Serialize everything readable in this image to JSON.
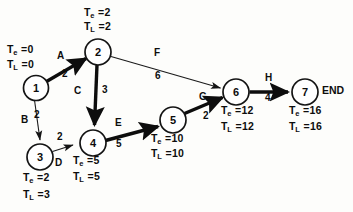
{
  "diagram": {
    "end_label": "END",
    "nodes": [
      {
        "id": "1",
        "label": "1",
        "cx": 36,
        "cy": 88,
        "r": 12.5,
        "te": "T",
        "te_sub": "e",
        "te_val": "= 0",
        "tl": "T",
        "tl_sub": "L",
        "tl_val": "= 0",
        "te_text": "T",
        "te_value": 0,
        "tl_value": 0,
        "te_x": 6,
        "te_y": 45,
        "tl_x": 6,
        "tl_y": 59
      },
      {
        "id": "2",
        "label": "2",
        "cx": 98,
        "cy": 52,
        "r": 13,
        "te_value": 2,
        "tl_value": 2,
        "te_x": 84,
        "te_y": 8,
        "tl_x": 84,
        "tl_y": 22
      },
      {
        "id": "3",
        "label": "3",
        "cx": 40,
        "cy": 157,
        "r": 13,
        "te_value": 2,
        "tl_value": 3,
        "te_x": 22,
        "te_y": 175,
        "tl_x": 22,
        "tl_y": 191
      },
      {
        "id": "4",
        "label": "4",
        "cx": 93,
        "cy": 143,
        "r": 13,
        "te_value": 5,
        "tl_value": 5,
        "te_x": 72,
        "te_y": 158,
        "tl_x": 72,
        "tl_y": 173
      },
      {
        "id": "5",
        "label": "5",
        "cx": 173,
        "cy": 120,
        "r": 13,
        "te_value": 10,
        "tl_value": 10,
        "te_x": 150,
        "te_y": 136,
        "tl_x": 150,
        "tl_y": 150
      },
      {
        "id": "6",
        "label": "6",
        "cx": 236,
        "cy": 92,
        "r": 13,
        "te_value": 12,
        "tl_value": 12,
        "te_x": 220,
        "te_y": 107,
        "tl_x": 220,
        "tl_y": 122
      },
      {
        "id": "7",
        "label": "7",
        "cx": 305,
        "cy": 92,
        "r": 13,
        "te_value": 16,
        "tl_value": 16,
        "te_x": 288,
        "te_y": 107,
        "tl_x": 288,
        "tl_y": 122
      }
    ],
    "edges": [
      {
        "id": "A",
        "from": "1",
        "to": "2",
        "letter": "A",
        "duration": 2,
        "critical": true,
        "letter_x": 57,
        "letter_y": 56,
        "dur_x": 62,
        "dur_y": 74
      },
      {
        "id": "B",
        "from": "1",
        "to": "3",
        "letter": "B",
        "duration": 2,
        "critical": false,
        "letter_x": 22,
        "letter_y": 120,
        "dur_x": 36,
        "dur_y": 115
      },
      {
        "id": "C",
        "from": "2",
        "to": "4",
        "letter": "C",
        "duration": 3,
        "critical": true,
        "letter_x": 75,
        "letter_y": 92,
        "dur_x": 99,
        "dur_y": 90
      },
      {
        "id": "D",
        "from": "3",
        "to": "4",
        "letter": "D",
        "duration": 2,
        "critical": false,
        "letter_x": 57,
        "letter_y": 157,
        "dur_x": 58,
        "dur_y": 132
      },
      {
        "id": "E",
        "from": "4",
        "to": "5",
        "letter": "E",
        "duration": 5,
        "critical": true,
        "letter_x": 116,
        "letter_y": 123,
        "dur_x": 117,
        "dur_y": 143
      },
      {
        "id": "F",
        "from": "2",
        "to": "6",
        "letter": "F",
        "duration": 6,
        "critical": false,
        "letter_x": 155,
        "letter_y": 53,
        "dur_x": 155,
        "dur_y": 76
      },
      {
        "id": "G",
        "from": "5",
        "to": "6",
        "letter": "G",
        "duration": 2,
        "critical": true,
        "letter_x": 200,
        "letter_y": 97,
        "dur_x": 203,
        "dur_y": 115
      },
      {
        "id": "H",
        "from": "6",
        "to": "7",
        "letter": "H",
        "duration": 4,
        "critical": true,
        "letter_x": 266,
        "letter_y": 78,
        "dur_x": 266,
        "dur_y": 97
      }
    ],
    "time_symbols": {
      "earliest": "T",
      "earliest_sub": "e",
      "latest": "T",
      "latest_sub": "L",
      "equals": "="
    },
    "end_x": 323,
    "end_y": 85
  }
}
